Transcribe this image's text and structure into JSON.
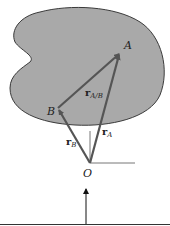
{
  "diagram": {
    "colors": {
      "body_fill": "#a9a9a9",
      "body_stroke": "#3a3a3a",
      "vector": "#555555",
      "axis": "#777777",
      "text": "#222222"
    },
    "points": {
      "A": {
        "label": "A"
      },
      "B": {
        "label": "B"
      },
      "O": {
        "label": "O"
      }
    },
    "vectors": {
      "r_A_B": {
        "symbol": "r",
        "subscript": "A/B"
      },
      "r_A": {
        "symbol": "r",
        "subscript": "A"
      },
      "r_B": {
        "symbol": "r",
        "subscript": "B"
      }
    }
  }
}
